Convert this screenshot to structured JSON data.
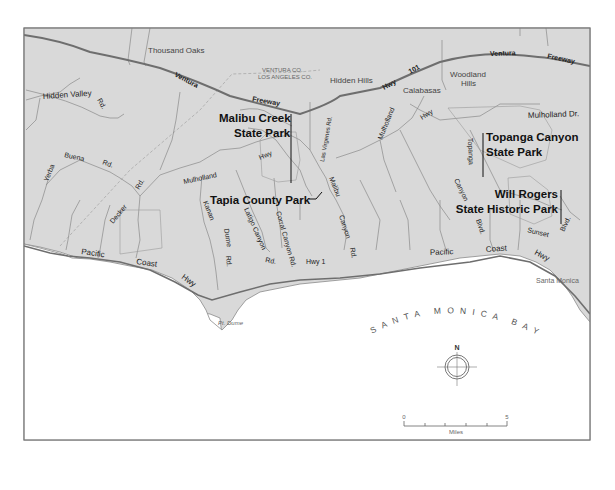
{
  "map": {
    "colors": {
      "land": "#d9d9d9",
      "ocean": "#ffffff",
      "highway": "#6e6e6e",
      "road": "#8a8a8a",
      "boundary": "#a8a8a8",
      "frame": "#777777",
      "label": "#111111"
    },
    "places": {
      "thousand_oaks": "Thousand Oaks",
      "county_line_top": "VENTURA CO.",
      "county_line_bottom": "LOS ANGELES CO.",
      "hidden_hills": "Hidden Hills",
      "calabasas": "Calabasas",
      "woodland_hills_1": "Woodland",
      "woodland_hills_2": "Hills",
      "santa_monica": "Santa Monica",
      "pt_dume": "Pt. Dume"
    },
    "freeway": {
      "ventura_left": "Ventura",
      "freeway_left": "Freeway",
      "hwy": "Hwy",
      "route": "101",
      "ventura_right": "Ventura",
      "freeway_right": "Freeway"
    },
    "roads": {
      "hidden_valley": "Hidden Valley",
      "hidden_valley_rd": "Rd.",
      "yerba": "Yerba",
      "buena": "Buena",
      "buena_rd": "Rd.",
      "decker": "Decker",
      "decker_rd": "Rd.",
      "mulholland_left": "Mulholland",
      "mulholland_hwy_left": "Hwy",
      "mulholland_mid": "Mulholland",
      "mulholland_hwy_mid": "Hwy",
      "mulholland_dr": "Mulholland Dr.",
      "las_virgenes": "Las Virgenes Rd.",
      "malibu": "Malibu",
      "malibu_canyon": "Canyon",
      "malibu_rd": "Rd.",
      "kanan": "Kanan",
      "dume": "Dume",
      "dume_rd": "Rd.",
      "latigo": "Latigo Canyon",
      "latigo_rd": "Rd.",
      "corral": "Corral Canyon Rd.",
      "topanga": "Topanga",
      "topanga_canyon": "Canyon",
      "topanga_blvd": "Blvd.",
      "sunset": "Sunset",
      "sunset_blvd": "Blvd.",
      "pch_pacific_left": "Pacific",
      "pch_coast_left": "Coast",
      "pch_hwy_left": "Hwy",
      "pch_hwy1": "Hwy 1",
      "pch_pacific_right": "Pacific",
      "pch_coast_right": "Coast",
      "pch_hwy_right": "Hwy"
    },
    "parks": {
      "malibu_creek_1": "Malibu Creek",
      "malibu_creek_2": "State Park",
      "tapia": "Tapia County Park",
      "topanga_1": "Topanga Canyon",
      "topanga_2": "State Park",
      "will_rogers_1": "Will Rogers",
      "will_rogers_2": "State Historic Park"
    },
    "water": {
      "bay": "SANTA MONICA BAY"
    },
    "compass": {
      "north_label": "N"
    },
    "scale_bar": {
      "min_label": "0",
      "max_label": "5",
      "unit_label": "Miles",
      "ticks": 5
    }
  }
}
